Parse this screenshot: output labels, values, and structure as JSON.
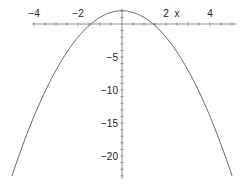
{
  "chart_data": {
    "type": "line",
    "title": "",
    "xlabel": "x",
    "ylabel": "",
    "function": "y = 2 - x^2",
    "x_range": [
      -5,
      5
    ],
    "y_range": [
      -23,
      2
    ],
    "xticks": [
      -4,
      -2,
      2,
      4
    ],
    "yticks": [
      -5,
      -10,
      -15,
      -20
    ],
    "xtick_labels": [
      "−4",
      "−2",
      "2",
      "4"
    ],
    "ytick_labels": [
      "−5",
      "−10",
      "−15",
      "−20"
    ],
    "series": [
      {
        "name": "curve",
        "x": [
          -5,
          -4,
          -3,
          -2,
          -1,
          0,
          1,
          2,
          3,
          4,
          5
        ],
        "y": [
          -23,
          -14,
          -7,
          -2,
          1,
          2,
          1,
          -2,
          -7,
          -14,
          -23
        ]
      }
    ],
    "grid": false,
    "legend": null,
    "color": "#555555"
  }
}
